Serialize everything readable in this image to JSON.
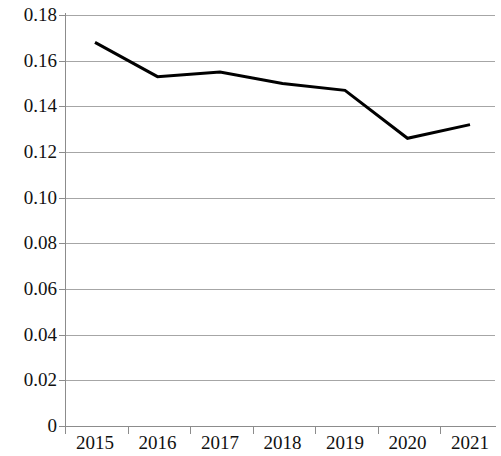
{
  "chart_data": {
    "type": "line",
    "title": "",
    "subtitle": "",
    "xlabel": "",
    "ylabel": "",
    "categories": [
      "2015",
      "2016",
      "2017",
      "2018",
      "2019",
      "2020",
      "2021"
    ],
    "series": [
      {
        "name": "",
        "values": [
          0.168,
          0.153,
          0.155,
          0.15,
          0.147,
          0.126,
          0.132
        ],
        "color": "#000000",
        "line_width": 3,
        "markers": false
      }
    ],
    "ylim": [
      0,
      0.18
    ],
    "ytick_step": 0.02,
    "ytick_labels": [
      "0.18",
      "0.16",
      "0.14",
      "0.12",
      "0.10",
      "0.08",
      "0.06",
      "0.04",
      "0.02",
      "0"
    ],
    "ytick_values": [
      0.18,
      0.16,
      0.14,
      0.12,
      0.1,
      0.08,
      0.06,
      0.04,
      0.02,
      0
    ],
    "xtick_labels": [
      "2015",
      "2016",
      "2017",
      "2018",
      "2019",
      "2020",
      "2021"
    ],
    "grid": {
      "horizontal": true,
      "vertical": false,
      "color": "#a6a6a6"
    },
    "legend": {
      "visible": false,
      "position": "none",
      "entries": []
    },
    "axis_color": "#8c8c8c",
    "background": "#ffffff",
    "annotations": []
  }
}
